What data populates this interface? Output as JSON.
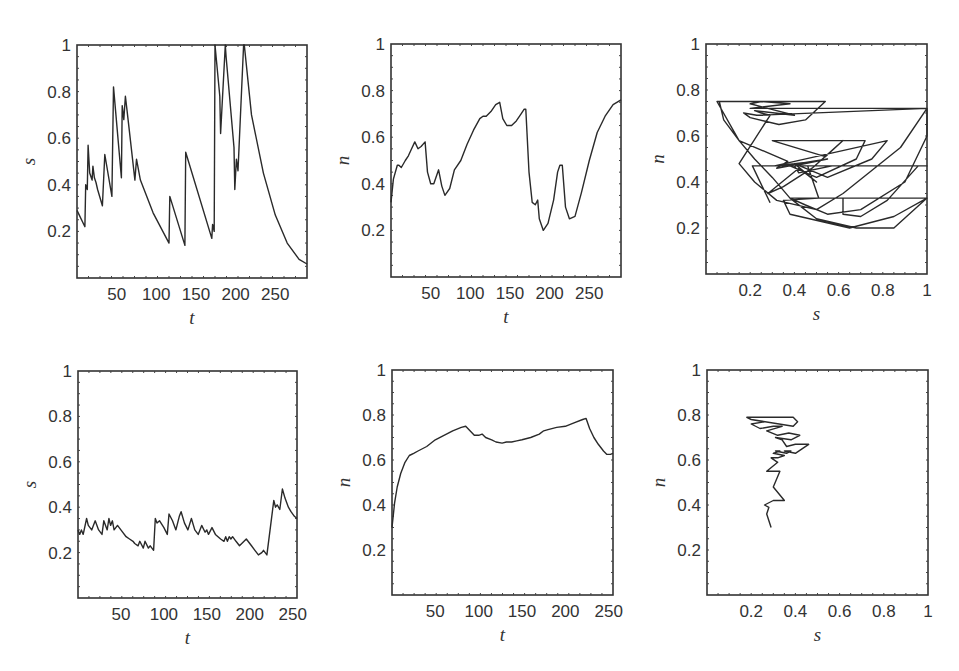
{
  "figure": {
    "layout": "2x3 grid of line / phase plots",
    "line_color": "#2a2a2a",
    "frame_color": "#333333"
  },
  "chart_data": [
    {
      "id": "top-left",
      "type": "line",
      "title": "",
      "xlabel": "t",
      "ylabel": "s",
      "xlim": [
        0,
        290
      ],
      "ylim": [
        0,
        1
      ],
      "xticks": [
        50,
        100,
        150,
        200,
        250
      ],
      "yticks": [
        0.2,
        0.4,
        0.6,
        0.8,
        1
      ],
      "box": {
        "x": 77,
        "y": 45,
        "w": 230,
        "h": 233
      },
      "x": [
        0,
        10,
        11,
        13,
        14,
        16,
        19,
        20,
        22,
        24,
        26,
        32,
        35,
        44,
        46,
        56,
        57,
        59,
        61,
        63,
        65,
        73,
        75,
        80,
        96,
        116,
        117,
        136,
        137,
        170,
        171,
        173,
        174,
        180,
        181,
        187,
        188,
        198,
        199,
        201,
        203,
        210,
        211,
        220,
        235,
        250,
        265,
        280,
        290
      ],
      "values": [
        0.29,
        0.22,
        0.4,
        0.38,
        0.57,
        0.45,
        0.42,
        0.48,
        0.43,
        0.41,
        0.38,
        0.31,
        0.53,
        0.35,
        0.82,
        0.43,
        0.74,
        0.68,
        0.78,
        0.72,
        0.66,
        0.42,
        0.51,
        0.42,
        0.28,
        0.15,
        0.35,
        0.14,
        0.54,
        0.17,
        0.23,
        0.2,
        1.0,
        0.78,
        0.62,
        1.0,
        0.95,
        0.56,
        0.38,
        0.51,
        0.46,
        1.0,
        1.0,
        0.7,
        0.45,
        0.27,
        0.15,
        0.08,
        0.06
      ]
    },
    {
      "id": "top-middle",
      "type": "line",
      "title": "",
      "xlabel": "t",
      "ylabel": "n",
      "xlim": [
        0,
        290
      ],
      "ylim": [
        0,
        1
      ],
      "xticks": [
        50,
        100,
        150,
        200,
        250
      ],
      "yticks": [
        0.2,
        0.4,
        0.6,
        0.8,
        1
      ],
      "box": {
        "x": 391,
        "y": 44,
        "w": 230,
        "h": 233
      },
      "x": [
        0,
        3,
        8,
        10,
        13,
        18,
        22,
        26,
        30,
        34,
        38,
        43,
        46,
        50,
        54,
        60,
        64,
        68,
        74,
        80,
        88,
        96,
        104,
        112,
        116,
        120,
        126,
        132,
        137,
        141,
        146,
        152,
        158,
        164,
        168,
        170,
        174,
        178,
        182,
        185,
        187,
        192,
        198,
        205,
        210,
        213,
        216,
        220,
        225,
        232,
        240,
        250,
        260,
        270,
        280,
        290
      ],
      "values": [
        0.32,
        0.42,
        0.48,
        0.48,
        0.47,
        0.5,
        0.52,
        0.55,
        0.58,
        0.55,
        0.56,
        0.58,
        0.45,
        0.4,
        0.4,
        0.46,
        0.39,
        0.35,
        0.38,
        0.46,
        0.5,
        0.57,
        0.63,
        0.68,
        0.69,
        0.69,
        0.71,
        0.74,
        0.75,
        0.68,
        0.65,
        0.65,
        0.67,
        0.7,
        0.72,
        0.72,
        0.45,
        0.32,
        0.31,
        0.33,
        0.25,
        0.2,
        0.23,
        0.33,
        0.45,
        0.48,
        0.48,
        0.3,
        0.25,
        0.26,
        0.36,
        0.5,
        0.62,
        0.69,
        0.74,
        0.76
      ]
    },
    {
      "id": "top-right",
      "type": "line",
      "title": "phase trajectory",
      "xlabel": "s",
      "ylabel": "n",
      "xlim": [
        0,
        1
      ],
      "ylim": [
        0,
        1
      ],
      "xticks": [
        0.2,
        0.4,
        0.6,
        0.8,
        1
      ],
      "yticks": [
        0.2,
        0.4,
        0.6,
        0.8,
        1
      ],
      "box": {
        "x": 706,
        "y": 44,
        "w": 221,
        "h": 230
      },
      "x": [
        0.29,
        0.21,
        0.57,
        0.42,
        0.4,
        0.55,
        0.35,
        0.5,
        0.31,
        0.82,
        0.75,
        0.55,
        0.4,
        0.5,
        0.42,
        0.28,
        0.35,
        0.48,
        0.62,
        0.54,
        0.3,
        0.72,
        0.68,
        0.5,
        0.38,
        0.32,
        0.37,
        0.15,
        0.05,
        0.14,
        0.54,
        0.45,
        0.33,
        0.2,
        0.17,
        0.23,
        1.0,
        1.0,
        0.88,
        0.62,
        0.5,
        0.32,
        0.22,
        0.15,
        0.29,
        0.25,
        0.22,
        0.4,
        0.28,
        0.2,
        0.25,
        0.38,
        0.2,
        1.0,
        1.0,
        0.9,
        0.7,
        0.55,
        0.45,
        0.38,
        1.0,
        0.85,
        0.65,
        0.38,
        0.35,
        0.51,
        0.46,
        0.38,
        1.0,
        0.96,
        0.82,
        0.7,
        0.62,
        0.62,
        1.0,
        0.85,
        0.68,
        0.5,
        0.38,
        0.3,
        0.22,
        0.15,
        0.08,
        0.06
      ],
      "values": [
        0.31,
        0.47,
        0.47,
        0.44,
        0.47,
        0.5,
        0.47,
        0.49,
        0.47,
        0.58,
        0.5,
        0.42,
        0.48,
        0.4,
        0.46,
        0.35,
        0.38,
        0.46,
        0.58,
        0.51,
        0.58,
        0.58,
        0.5,
        0.42,
        0.47,
        0.46,
        0.49,
        0.58,
        0.75,
        0.75,
        0.75,
        0.67,
        0.65,
        0.68,
        0.7,
        0.69,
        0.72,
        0.72,
        0.55,
        0.35,
        0.28,
        0.32,
        0.4,
        0.48,
        0.69,
        0.7,
        0.71,
        0.69,
        0.72,
        0.74,
        0.75,
        0.74,
        0.72,
        0.72,
        0.6,
        0.4,
        0.28,
        0.26,
        0.3,
        0.33,
        0.33,
        0.25,
        0.2,
        0.26,
        0.32,
        0.33,
        0.47,
        0.47,
        0.47,
        0.47,
        0.32,
        0.25,
        0.26,
        0.33,
        0.33,
        0.2,
        0.2,
        0.24,
        0.33,
        0.42,
        0.5,
        0.58,
        0.67,
        0.75
      ]
    },
    {
      "id": "bottom-left",
      "type": "line",
      "title": "",
      "xlabel": "t",
      "ylabel": "s",
      "xlim": [
        0,
        255
      ],
      "ylim": [
        0,
        1
      ],
      "xticks": [
        50,
        100,
        150,
        200,
        250
      ],
      "yticks": [
        0.2,
        0.4,
        0.6,
        0.8,
        1
      ],
      "box": {
        "x": 78,
        "y": 371,
        "w": 219,
        "h": 227
      },
      "x": [
        0,
        2,
        4,
        6,
        10,
        12,
        16,
        20,
        24,
        28,
        30,
        34,
        36,
        38,
        40,
        42,
        46,
        50,
        56,
        60,
        64,
        66,
        70,
        72,
        76,
        78,
        82,
        84,
        86,
        88,
        90,
        92,
        95,
        100,
        104,
        106,
        110,
        114,
        118,
        120,
        124,
        128,
        132,
        136,
        140,
        144,
        148,
        150,
        152,
        156,
        160,
        166,
        170,
        172,
        174,
        176,
        178,
        180,
        184,
        188,
        196,
        202,
        206,
        210,
        214,
        216,
        218,
        220,
        228,
        230,
        232,
        235,
        238,
        241,
        245,
        248,
        252,
        255
      ],
      "values": [
        0.3,
        0.28,
        0.3,
        0.28,
        0.35,
        0.32,
        0.3,
        0.34,
        0.3,
        0.28,
        0.34,
        0.3,
        0.35,
        0.32,
        0.34,
        0.3,
        0.32,
        0.3,
        0.27,
        0.26,
        0.25,
        0.24,
        0.23,
        0.25,
        0.22,
        0.25,
        0.22,
        0.23,
        0.22,
        0.21,
        0.35,
        0.33,
        0.34,
        0.31,
        0.28,
        0.37,
        0.34,
        0.3,
        0.36,
        0.38,
        0.33,
        0.3,
        0.35,
        0.3,
        0.28,
        0.32,
        0.29,
        0.3,
        0.28,
        0.31,
        0.28,
        0.26,
        0.25,
        0.27,
        0.25,
        0.27,
        0.26,
        0.27,
        0.25,
        0.23,
        0.26,
        0.23,
        0.21,
        0.19,
        0.2,
        0.21,
        0.2,
        0.19,
        0.43,
        0.4,
        0.41,
        0.39,
        0.48,
        0.44,
        0.4,
        0.38,
        0.36,
        0.35
      ]
    },
    {
      "id": "bottom-middle",
      "type": "line",
      "title": "",
      "xlabel": "t",
      "ylabel": "n",
      "xlim": [
        0,
        255
      ],
      "ylim": [
        0,
        1
      ],
      "xticks": [
        50,
        100,
        150,
        200,
        250
      ],
      "yticks": [
        0.2,
        0.4,
        0.6,
        0.8,
        1
      ],
      "box": {
        "x": 392,
        "y": 370,
        "w": 221,
        "h": 225
      },
      "x": [
        0,
        3,
        6,
        10,
        15,
        20,
        25,
        30,
        40,
        50,
        60,
        70,
        80,
        85,
        90,
        95,
        100,
        104,
        108,
        115,
        120,
        127,
        132,
        138,
        144,
        150,
        160,
        170,
        175,
        180,
        190,
        200,
        210,
        220,
        224,
        228,
        233,
        238,
        244,
        248,
        252,
        255
      ],
      "values": [
        0.3,
        0.41,
        0.48,
        0.54,
        0.59,
        0.62,
        0.63,
        0.64,
        0.66,
        0.69,
        0.71,
        0.73,
        0.745,
        0.75,
        0.73,
        0.71,
        0.71,
        0.715,
        0.7,
        0.69,
        0.68,
        0.675,
        0.68,
        0.68,
        0.685,
        0.69,
        0.7,
        0.715,
        0.73,
        0.735,
        0.745,
        0.75,
        0.765,
        0.78,
        0.785,
        0.74,
        0.7,
        0.67,
        0.64,
        0.625,
        0.625,
        0.63
      ]
    },
    {
      "id": "bottom-right",
      "type": "line",
      "title": "phase trajectory",
      "xlabel": "s",
      "ylabel": "n",
      "xlim": [
        0,
        1
      ],
      "ylim": [
        0,
        1
      ],
      "xticks": [
        0.2,
        0.4,
        0.6,
        0.8,
        1
      ],
      "yticks": [
        0.2,
        0.4,
        0.6,
        0.8,
        1
      ],
      "box": {
        "x": 707,
        "y": 370,
        "w": 221,
        "h": 225
      },
      "x": [
        0.29,
        0.27,
        0.28,
        0.26,
        0.3,
        0.35,
        0.3,
        0.33,
        0.27,
        0.32,
        0.29,
        0.32,
        0.35,
        0.3,
        0.33,
        0.31,
        0.36,
        0.38,
        0.35,
        0.4,
        0.43,
        0.46,
        0.4,
        0.36,
        0.34,
        0.31,
        0.38,
        0.42,
        0.37,
        0.32,
        0.27,
        0.34,
        0.3,
        0.24,
        0.2,
        0.26,
        0.2,
        0.18,
        0.2,
        0.28,
        0.39,
        0.41,
        0.39,
        0.2
      ],
      "values": [
        0.3,
        0.36,
        0.39,
        0.4,
        0.42,
        0.42,
        0.48,
        0.55,
        0.55,
        0.59,
        0.61,
        0.61,
        0.62,
        0.63,
        0.64,
        0.64,
        0.63,
        0.64,
        0.64,
        0.63,
        0.65,
        0.67,
        0.67,
        0.66,
        0.69,
        0.7,
        0.69,
        0.71,
        0.72,
        0.71,
        0.73,
        0.75,
        0.75,
        0.74,
        0.76,
        0.77,
        0.78,
        0.79,
        0.79,
        0.79,
        0.79,
        0.77,
        0.75,
        0.78
      ]
    }
  ]
}
